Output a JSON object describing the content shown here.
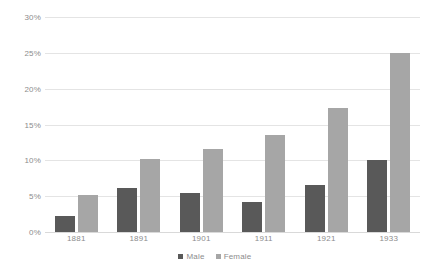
{
  "chart_data": {
    "type": "bar",
    "title": "",
    "subtitle": "",
    "xlabel": "",
    "ylabel": "",
    "categories": [
      "1881",
      "1891",
      "1901",
      "1911",
      "1921",
      "1933"
    ],
    "series": [
      {
        "name": "Male",
        "color": "#595959",
        "values": [
          2.2,
          6.2,
          5.4,
          4.2,
          6.5,
          10.1
        ]
      },
      {
        "name": "Female",
        "color": "#a6a6a6",
        "values": [
          5.2,
          10.2,
          11.6,
          13.5,
          17.3,
          25.0
        ]
      }
    ],
    "ylim": [
      0,
      30
    ],
    "ytick_values": [
      0,
      5,
      10,
      15,
      20,
      25,
      30
    ],
    "ytick_labels": [
      "0%",
      "5%",
      "10%",
      "15%",
      "20%",
      "25%",
      "30%"
    ],
    "grid": {
      "horizontal": true,
      "vertical": false,
      "color": "#e4e4e4"
    },
    "legend": {
      "position": "bottom-center",
      "entries": [
        "Male",
        "Female"
      ]
    },
    "annotations": []
  }
}
